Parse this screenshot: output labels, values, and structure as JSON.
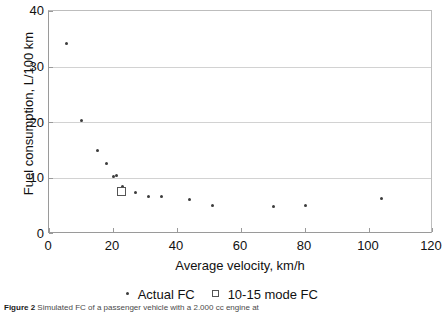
{
  "chart_data": {
    "type": "scatter",
    "title": "",
    "xlabel": "Average velocity, km/h",
    "ylabel": "Fuel consumption, L/100 km",
    "xlim": [
      0,
      120
    ],
    "ylim": [
      0,
      40
    ],
    "xticks": [
      0,
      20,
      40,
      60,
      80,
      100,
      120
    ],
    "yticks": [
      0,
      10,
      20,
      30,
      40
    ],
    "grid": "horizontal",
    "legend_position": "bottom",
    "series": [
      {
        "name": "Actual FC",
        "marker": "dot",
        "color": "#3c3c3c",
        "points": [
          {
            "x": 5.5,
            "y": 34.2
          },
          {
            "x": 10.0,
            "y": 20.4
          },
          {
            "x": 15.0,
            "y": 15.0
          },
          {
            "x": 18.0,
            "y": 12.6
          },
          {
            "x": 20.0,
            "y": 10.3
          },
          {
            "x": 21.0,
            "y": 10.5
          },
          {
            "x": 23.0,
            "y": 8.6
          },
          {
            "x": 27.0,
            "y": 7.4
          },
          {
            "x": 31.0,
            "y": 6.8
          },
          {
            "x": 35.0,
            "y": 6.7
          },
          {
            "x": 44.0,
            "y": 6.1
          },
          {
            "x": 51.0,
            "y": 5.2
          },
          {
            "x": 70.0,
            "y": 5.0
          },
          {
            "x": 80.0,
            "y": 5.1
          },
          {
            "x": 104.0,
            "y": 6.3
          }
        ]
      },
      {
        "name": "10-15 mode FC",
        "marker": "open-square",
        "color": "#555555",
        "points": [
          {
            "x": 22.5,
            "y": 7.6
          }
        ]
      }
    ]
  },
  "legend": {
    "entries": [
      {
        "label": "Actual FC",
        "marker": "dot"
      },
      {
        "label": "10-15 mode FC",
        "marker": "open-square"
      }
    ]
  },
  "caption": {
    "figure_number": "Figure 2",
    "text": "Simulated FC of a passenger vehicle with a 2.000 cc engine at"
  }
}
